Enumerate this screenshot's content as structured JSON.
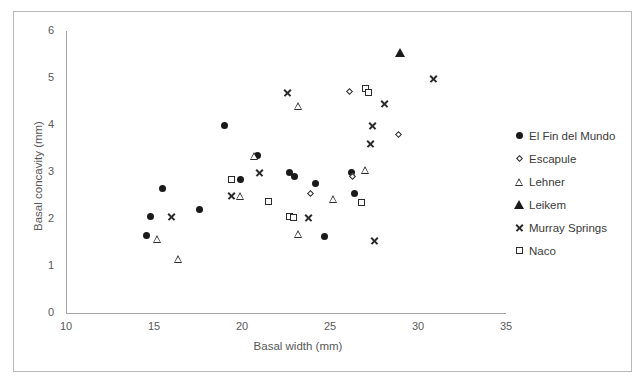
{
  "chart_data": {
    "type": "scatter",
    "title": "",
    "xlabel": "Basal width (mm)",
    "ylabel": "Basal concavity (mm)",
    "xlim": [
      10,
      35
    ],
    "ylim": [
      0,
      6
    ],
    "xticks": [
      10,
      15,
      20,
      25,
      30,
      35
    ],
    "yticks": [
      0,
      1,
      2,
      3,
      4,
      5,
      6
    ],
    "grid": false,
    "legend_position": "right",
    "series": [
      {
        "name": "El Fin del Mundo",
        "marker": "filled-circle",
        "color": "#1a1a1a",
        "points": [
          [
            14.6,
            1.65
          ],
          [
            14.8,
            2.05
          ],
          [
            15.5,
            2.65
          ],
          [
            17.6,
            2.2
          ],
          [
            19.0,
            4.0
          ],
          [
            19.9,
            2.83
          ],
          [
            20.9,
            3.35
          ],
          [
            22.7,
            3.0
          ],
          [
            23.0,
            2.9
          ],
          [
            24.2,
            2.75
          ],
          [
            24.7,
            1.62
          ],
          [
            26.2,
            3.0
          ],
          [
            26.4,
            2.55
          ]
        ]
      },
      {
        "name": "Escapule",
        "marker": "open-diamond",
        "color": "#2b2b2b",
        "points": [
          [
            23.9,
            2.55
          ],
          [
            26.1,
            4.72
          ],
          [
            26.3,
            2.9
          ],
          [
            28.9,
            3.8
          ]
        ]
      },
      {
        "name": "Lehner",
        "marker": "open-triangle",
        "color": "#2b2b2b",
        "points": [
          [
            15.2,
            1.57
          ],
          [
            16.4,
            1.15
          ],
          [
            19.9,
            2.5
          ],
          [
            20.7,
            3.35
          ],
          [
            23.2,
            1.68
          ],
          [
            23.2,
            4.4
          ],
          [
            25.2,
            2.43
          ],
          [
            27.0,
            3.05
          ]
        ]
      },
      {
        "name": "Leikem",
        "marker": "filled-triangle",
        "color": "#1a1a1a",
        "points": [
          [
            29.0,
            5.55
          ]
        ]
      },
      {
        "name": "Murray Springs",
        "marker": "x-cross",
        "color": "#2b2b2b",
        "points": [
          [
            16.0,
            2.05
          ],
          [
            19.4,
            2.5
          ],
          [
            21.0,
            3.0
          ],
          [
            22.6,
            4.7
          ],
          [
            23.8,
            2.03
          ],
          [
            27.3,
            3.6
          ],
          [
            27.4,
            4.0
          ],
          [
            27.5,
            1.55
          ],
          [
            28.1,
            4.45
          ],
          [
            30.9,
            5.0
          ]
        ]
      },
      {
        "name": "Naco",
        "marker": "open-square",
        "color": "#2b2b2b",
        "points": [
          [
            19.4,
            2.83
          ],
          [
            21.5,
            2.37
          ],
          [
            22.7,
            2.05
          ],
          [
            22.9,
            2.03
          ],
          [
            26.8,
            2.35
          ],
          [
            27.0,
            4.78
          ],
          [
            27.2,
            4.7
          ]
        ]
      }
    ]
  },
  "axes": {
    "x_tick_labels": [
      "10",
      "15",
      "20",
      "25",
      "30",
      "35"
    ],
    "y_tick_labels": [
      "0",
      "1",
      "2",
      "3",
      "4",
      "5",
      "6"
    ],
    "x_title": "Basal width (mm)",
    "y_title": "Basal concavity (mm)"
  },
  "legend": {
    "entries": [
      {
        "label": "El Fin del Mundo",
        "marker": "filled-circle"
      },
      {
        "label": "Escapule",
        "marker": "open-diamond"
      },
      {
        "label": "Lehner",
        "marker": "open-triangle"
      },
      {
        "label": "Leikem",
        "marker": "filled-triangle"
      },
      {
        "label": "Murray Springs",
        "marker": "x-cross"
      },
      {
        "label": "Naco",
        "marker": "open-square"
      }
    ]
  }
}
